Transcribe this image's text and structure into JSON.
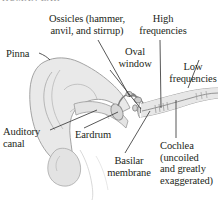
{
  "figure": {
    "caption_sliver": "HUMAN EAR",
    "colors": {
      "ink": "#231f20",
      "tissue_fill": "#e9e9e9",
      "tissue_fill_dark": "#dcdcdc",
      "outline": "#9a9a9a",
      "leader_line": "#3a3a3a",
      "background": "#ffffff"
    },
    "labels": [
      {
        "id": "ossicles",
        "text": "Ossicles (hammer,\nanvil, and stirrup)",
        "align": "center"
      },
      {
        "id": "high",
        "text": "High\nfrequencies",
        "align": "center"
      },
      {
        "id": "pinna",
        "text": "Pinna",
        "align": "left"
      },
      {
        "id": "oval",
        "text": "Oval\nwindow",
        "align": "center"
      },
      {
        "id": "low",
        "text": "Low\nfrequencies",
        "align": "center"
      },
      {
        "id": "auditory",
        "text": "Auditory\ncanal",
        "align": "left"
      },
      {
        "id": "eardrum",
        "text": "Eardrum",
        "align": "left"
      },
      {
        "id": "basilar",
        "text": "Basilar\nmembrane",
        "align": "center"
      },
      {
        "id": "cochlea",
        "text": "Cochlea\n(uncoiled\nand greatly\nexaggerated)",
        "align": "left"
      }
    ],
    "anatomy_parts": [
      "pinna",
      "auditory-canal",
      "eardrum",
      "ossicles",
      "oval-window",
      "cochlea",
      "basilar-membrane"
    ]
  }
}
